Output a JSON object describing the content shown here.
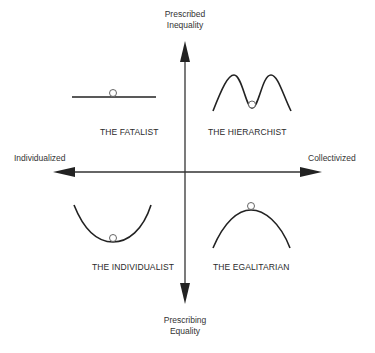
{
  "axes": {
    "top": {
      "line1": "Prescribed",
      "line2": "Inequality"
    },
    "bottom": {
      "line1": "Prescribing",
      "line2": "Equality"
    },
    "left": "Individualized",
    "right": "Collectivized"
  },
  "quadrants": {
    "top_left": {
      "label": "THE FATALIST",
      "curve": "flat-line"
    },
    "top_right": {
      "label": "THE HIERARCHIST",
      "curve": "double-peak"
    },
    "bottom_left": {
      "label": "THE INDIVIDUALIST",
      "curve": "valley"
    },
    "bottom_right": {
      "label": "THE EGALITARIAN",
      "curve": "hill"
    }
  },
  "colors": {
    "line": "#222222",
    "ball": "#ffffff",
    "ball_stroke": "#444444"
  }
}
